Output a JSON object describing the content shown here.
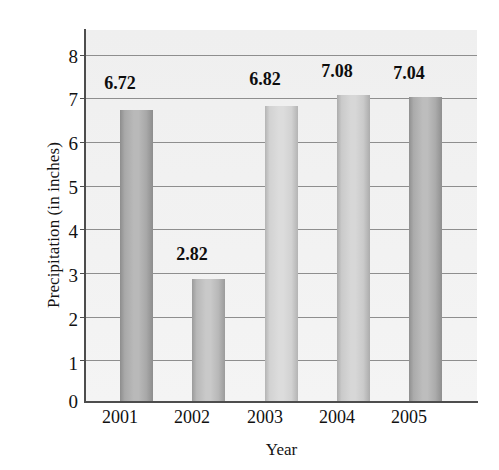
{
  "chart_data": {
    "type": "bar",
    "title": "",
    "xlabel": "Year",
    "ylabel": "Precipitation (in inches)",
    "categories": [
      "2001",
      "2002",
      "2003",
      "2004",
      "2005"
    ],
    "values": [
      6.72,
      2.82,
      6.82,
      7.08,
      7.04
    ],
    "value_labels": [
      "6.72",
      "2.82",
      "6.82",
      "7.08",
      "7.04"
    ],
    "ylim": [
      0,
      8
    ],
    "ytick_labels": [
      "0",
      "1",
      "2",
      "3",
      "4",
      "5",
      "6",
      "7",
      "8"
    ],
    "ytick_values": [
      0,
      1,
      2,
      3,
      4,
      5,
      6,
      7,
      8
    ],
    "grid": "horizontal",
    "legend": "none",
    "series": [
      {
        "name": "Precipitation",
        "values": [
          6.72,
          2.82,
          6.82,
          7.08,
          7.04
        ]
      }
    ],
    "bar_styles": [
      {
        "edge": "#8d8d8d",
        "mid": "#b9b9b9",
        "core": "#a8a8a8"
      },
      {
        "edge": "#9b9b9b",
        "mid": "#c9c9c9",
        "core": "#b8b8b8"
      },
      {
        "edge": "#b4b4b4",
        "mid": "#dcdcdc",
        "core": "#d2d2d2"
      },
      {
        "edge": "#acacac",
        "mid": "#d7d7d7",
        "core": "#cacaca"
      },
      {
        "edge": "#8f8f8f",
        "mid": "#bdbdbd",
        "core": "#ababab"
      }
    ],
    "colors": {
      "plot_background": "#f1f1f1",
      "page_background": "#ffffff",
      "axis": "#4d4d4d",
      "gridline": "#8e8e8e",
      "text": "#111111"
    }
  }
}
